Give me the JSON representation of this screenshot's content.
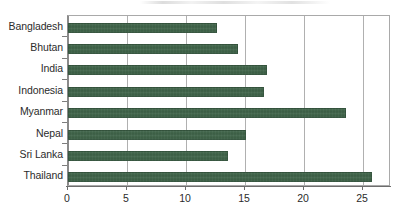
{
  "chart_data": {
    "type": "bar",
    "orientation": "horizontal",
    "title": "",
    "xlabel": "",
    "ylabel": "",
    "categories": [
      "Bangladesh",
      "Bhutan",
      "India",
      "Indonesia",
      "Myanmar",
      "Nepal",
      "Sri Lanka",
      "Thailand"
    ],
    "values": [
      12.6,
      14.4,
      16.9,
      16.6,
      23.6,
      15.1,
      13.6,
      25.8
    ],
    "xlim": [
      0,
      27.4
    ],
    "xticks": [
      0,
      5,
      10,
      15,
      20,
      25
    ],
    "xticklabels": [
      "0",
      "5",
      "10",
      "15",
      "20",
      "25"
    ],
    "grid": "vertical",
    "legend": "none",
    "series": [
      {
        "name": "value",
        "color": "#3f6449",
        "values": [
          12.6,
          14.4,
          16.9,
          16.6,
          23.6,
          15.1,
          13.6,
          25.8
        ]
      }
    ]
  },
  "colors": {
    "bar": "#3f6449",
    "grid": "#b0b0b0",
    "axis": "#6d6d6d",
    "text": "#2b2b2b",
    "background": "#ffffff"
  }
}
